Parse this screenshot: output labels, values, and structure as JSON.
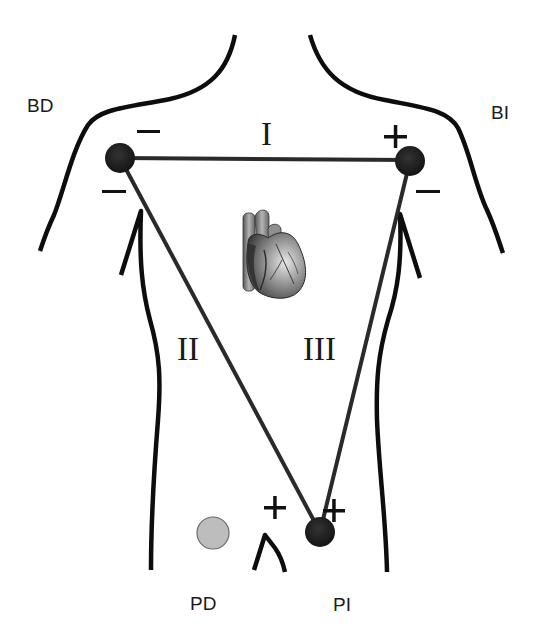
{
  "diagram": {
    "colors": {
      "outline": "#0d0d0d",
      "lead_line": "#2a2a2a",
      "electrode": "#1c1c1c",
      "ground_electrode": "#bdbdbd",
      "ground_electrode_border": "#6a6a6a",
      "background": "#ffffff"
    },
    "limb_labels": {
      "right_arm": "BD",
      "left_arm": "BI",
      "right_leg": "PD",
      "left_leg": "PI"
    },
    "leads": {
      "lead_1": "I",
      "lead_2": "II",
      "lead_3": "III"
    },
    "polarity": {
      "ra_lead1": "−",
      "ra_lead2": "−",
      "la_lead1": "+",
      "la_lead3": "−",
      "ll_lead2": "+",
      "ll_lead3": "+"
    },
    "electrodes": [
      {
        "id": "right-arm",
        "cx": 120,
        "cy": 158,
        "r": 15
      },
      {
        "id": "left-arm",
        "cx": 410,
        "cy": 161,
        "r": 15
      },
      {
        "id": "left-leg",
        "cx": 320,
        "cy": 532,
        "r": 15
      },
      {
        "id": "right-leg-ground",
        "cx": 213,
        "cy": 533,
        "r": 16
      }
    ],
    "icons": {
      "heart": "heart-icon"
    }
  }
}
